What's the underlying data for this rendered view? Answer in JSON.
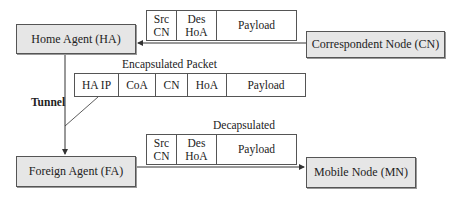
{
  "nodes": {
    "home_agent": "Home Agent (HA)",
    "correspondent_node": "Correspondent Node (CN)",
    "foreign_agent": "Foreign Agent (FA)",
    "mobile_node": "Mobile Node (MN)"
  },
  "packets": {
    "original": {
      "cells": [
        "Src\nCN",
        "Des\nHoA",
        "Payload"
      ]
    },
    "encapsulated": {
      "title": "Encapsulated Packet",
      "cells": [
        "HA IP",
        "CoA",
        "CN",
        "HoA",
        "Payload"
      ]
    },
    "decapsulated": {
      "title": "Decapsulated",
      "cells": [
        "Src\nCN",
        "Des\nHoA",
        "Payload"
      ]
    }
  },
  "labels": {
    "tunnel": "Tunnel"
  },
  "colors": {
    "node_fill": "#e6e6e6",
    "line": "#333333"
  }
}
